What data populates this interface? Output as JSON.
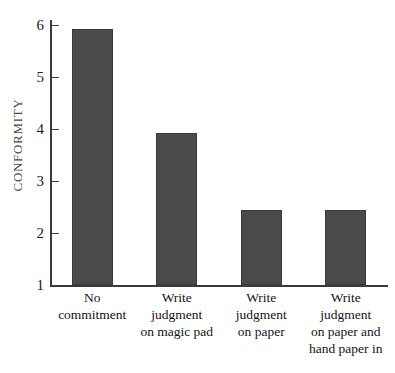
{
  "chart_data": {
    "type": "bar",
    "title": "",
    "xlabel": "",
    "ylabel": "CONFORMITY",
    "ylim": [
      1,
      6
    ],
    "grid": false,
    "legend": null,
    "yticks": [
      1,
      2,
      3,
      4,
      5,
      6
    ],
    "ytick_labels": [
      "1",
      "2",
      "3",
      "4",
      "5",
      "6"
    ],
    "categories": [
      "No commitment",
      "Write judgment on magic pad",
      "Write judgment on paper",
      "Write judgment on paper and hand paper in"
    ],
    "category_lines": [
      [
        "No",
        "commitment"
      ],
      [
        "Write",
        "judgment",
        "on magic pad"
      ],
      [
        "Write",
        "judgment",
        "on paper"
      ],
      [
        "Write",
        "judgment",
        "on paper and",
        "hand paper in"
      ]
    ],
    "values": [
      5.93,
      3.93,
      2.45,
      2.44
    ],
    "bar_color": "#4a4a4a",
    "axis_color": "#3b3b3b",
    "background": "#ffffff"
  }
}
